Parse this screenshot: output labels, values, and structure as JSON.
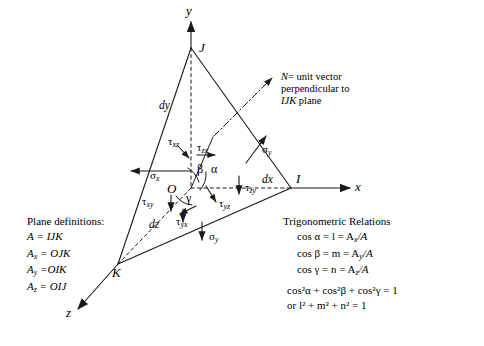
{
  "figure": {
    "type": "stress-tetrahedron-diagram",
    "axes": [
      {
        "name": "y-axis",
        "label": "y",
        "direction": "up"
      },
      {
        "name": "x-axis",
        "label": "x",
        "direction": "right"
      },
      {
        "name": "z-axis",
        "label": "z",
        "direction": "down-left"
      }
    ],
    "vertices": [
      {
        "name": "vertex-J",
        "label": "J"
      },
      {
        "name": "vertex-I",
        "label": "I"
      },
      {
        "name": "vertex-K",
        "label": "K"
      },
      {
        "name": "origin",
        "label": "O"
      }
    ],
    "dimensions": [
      {
        "name": "dy",
        "label": "dy"
      },
      {
        "name": "dx",
        "label": "dx"
      },
      {
        "name": "dz",
        "label": "dz"
      }
    ],
    "angles": [
      {
        "name": "alpha",
        "label": "α"
      },
      {
        "name": "beta",
        "label": "β"
      },
      {
        "name": "gamma",
        "label": "γ"
      }
    ],
    "stresses": [
      {
        "name": "sigma-x",
        "sym": "σ",
        "sub": "x"
      },
      {
        "name": "sigma-y-face",
        "sym": "σ",
        "sub": "y"
      },
      {
        "name": "sigma-y-bottom",
        "sym": "σ",
        "sub": "y"
      },
      {
        "name": "tau-xz",
        "sym": "τ",
        "sub": "xz"
      },
      {
        "name": "tau-zx",
        "sym": "τ",
        "sub": "zx"
      },
      {
        "name": "tau-zy",
        "sym": "τ",
        "sub": "zy"
      },
      {
        "name": "tau-yz",
        "sym": "τ",
        "sub": "yz"
      },
      {
        "name": "tau-xy",
        "sym": "τ",
        "sub": "xy"
      },
      {
        "name": "tau-yx",
        "sym": "τ",
        "sub": "yx"
      }
    ],
    "normal_note": {
      "line1_a": "N",
      "line1_b": "= unit vector",
      "line2": "perpendicular to",
      "line3_a": "IJK",
      "line3_b": "plane"
    }
  },
  "plane_definitions": {
    "heading": "Plane definitions:",
    "rows": [
      {
        "lhs": "A",
        "sub": "",
        "rhs": "IJK"
      },
      {
        "lhs": "A",
        "sub": "x",
        "rhs": "OJK"
      },
      {
        "lhs": "A",
        "sub": "y",
        "rhs": "OIK"
      },
      {
        "lhs": "A",
        "sub": "z",
        "rhs": "OIJ"
      }
    ]
  },
  "trigonometric_relations": {
    "heading": "Trigonometric Relations",
    "rows": [
      {
        "id": "cos-alpha",
        "text": "cos α = l = A",
        "sub": "x",
        "tail": "/A"
      },
      {
        "id": "cos-beta",
        "text": "cos β = m = A",
        "sub": "y",
        "tail": "/A"
      },
      {
        "id": "cos-gamma",
        "text": "cos γ = n = A",
        "sub": "z",
        "tail": "/A"
      }
    ],
    "identity": "cos²α + cos²β + cos²γ = 1",
    "identity_alt": "or l² + m² + n² = 1"
  },
  "colors": {
    "stroke": "#1a1a1a",
    "background": "#ffffff"
  }
}
